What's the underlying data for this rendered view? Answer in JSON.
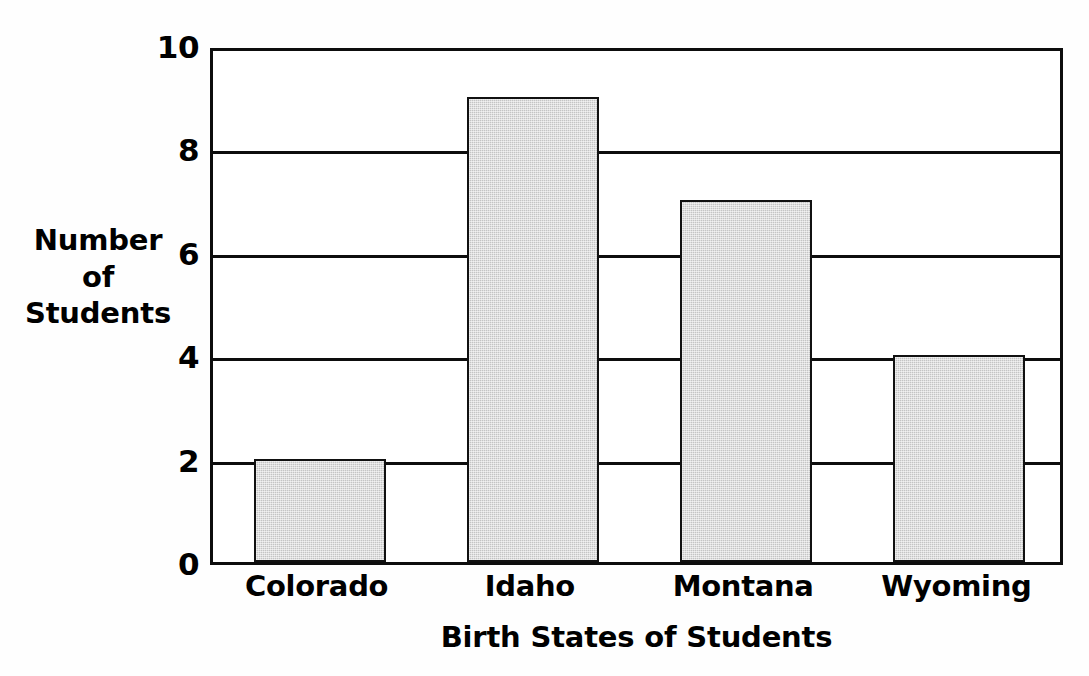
{
  "chart_data": {
    "type": "bar",
    "title": "",
    "xlabel": "Birth States of Students",
    "ylabel": "Number of Students",
    "ylabel_lines": [
      "Number",
      "of",
      "Students"
    ],
    "categories": [
      "Colorado",
      "Idaho",
      "Montana",
      "Wyoming"
    ],
    "values": [
      2,
      9,
      7,
      4
    ],
    "ylim": [
      0,
      10
    ],
    "ytick_step": 2,
    "ytick_labels": [
      "10",
      "8",
      "6",
      "4",
      "2",
      "0"
    ],
    "ytick_values": [
      10,
      8,
      6,
      4,
      2,
      0
    ],
    "grid": true,
    "grid_axis": "y",
    "legend": false,
    "series": [
      {
        "name": "Number of Students",
        "values": [
          2,
          9,
          7,
          4
        ]
      }
    ],
    "bar_fill_color": "#c4c4c4",
    "bar_edge_color": "#111111",
    "axis_color": "#0d0d0d",
    "background_color": "#ffffff"
  },
  "figure": {
    "y_axis_title": "Number of Students",
    "x_axis_title": "Birth States of Students"
  }
}
